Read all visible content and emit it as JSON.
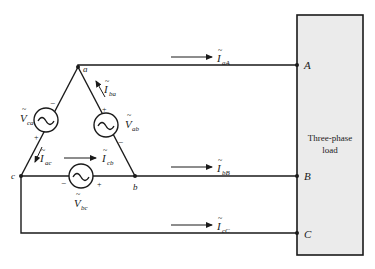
{
  "diagram": {
    "type": "three-phase delta source connected to three-phase load",
    "load": {
      "label_line1": "Three-phase",
      "label_line2": "load",
      "fill": "#ebebeb"
    },
    "nodes": {
      "a": "a",
      "b": "b",
      "c": "c",
      "A": "A",
      "B": "B",
      "C": "C"
    },
    "sources": [
      {
        "id": "Vca",
        "main": "V",
        "sub": "ca",
        "plus": "+",
        "minus": "−"
      },
      {
        "id": "Vab",
        "main": "V",
        "sub": "ab",
        "plus": "+",
        "minus": "−"
      },
      {
        "id": "Vbc",
        "main": "V",
        "sub": "bc",
        "plus": "+",
        "minus": "−"
      }
    ],
    "currents": [
      {
        "id": "IaA",
        "main": "I",
        "sub": "aA"
      },
      {
        "id": "IbB",
        "main": "I",
        "sub": "bB"
      },
      {
        "id": "IcC",
        "main": "I",
        "sub": "cC"
      },
      {
        "id": "Iba",
        "main": "I",
        "sub": "ba"
      },
      {
        "id": "Iac",
        "main": "I",
        "sub": "ac"
      },
      {
        "id": "Icb",
        "main": "I",
        "sub": "cb"
      }
    ],
    "tilde": "~",
    "source_symbol": "~"
  }
}
